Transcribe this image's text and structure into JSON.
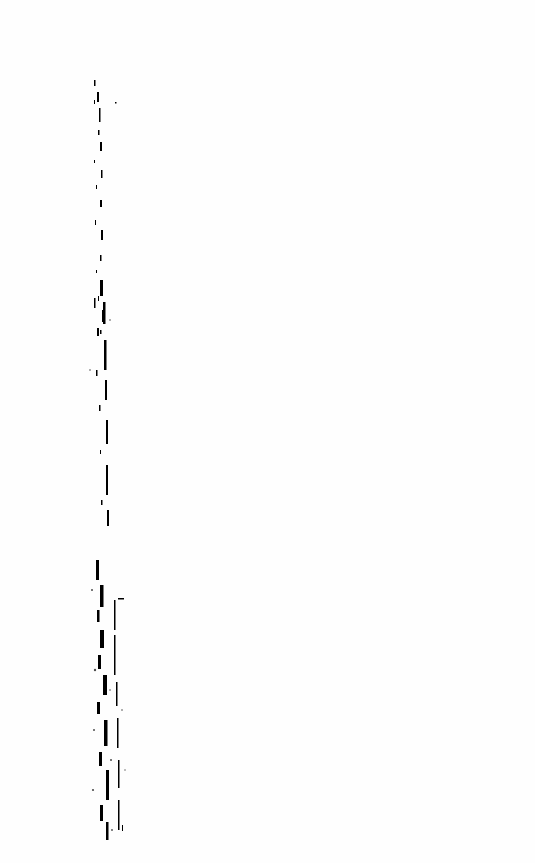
{
  "page": {
    "type": "blank-scanned-page",
    "background": "#ffffff",
    "artifact_color": "#000000",
    "text": []
  }
}
